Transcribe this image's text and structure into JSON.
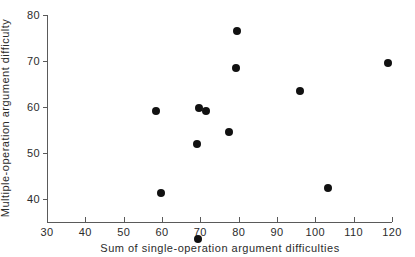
{
  "chart_data": {
    "type": "scatter",
    "title": "",
    "xlabel": "Sum of single-operation argument difficulties",
    "ylabel": "Multiple-operation argument difficulty",
    "xlim": [
      30,
      120
    ],
    "ylim": [
      31,
      80
    ],
    "xticks": [
      30,
      40,
      50,
      60,
      70,
      80,
      90,
      100,
      110,
      120
    ],
    "yticks": [
      40,
      50,
      60,
      70,
      80
    ],
    "xticklabels": [
      "30",
      "40",
      "50",
      "60",
      "70",
      "80",
      "90",
      "100",
      "110",
      "120"
    ],
    "yticklabels": [
      "40",
      "50",
      "60",
      "70",
      "80"
    ],
    "grid": false,
    "legend": null,
    "marker": "filled-circle",
    "marker_color": "#111111",
    "axis_color": "#5a5a5a",
    "background": "#ffffff",
    "points": [
      {
        "x": 58.5,
        "y": 59.2
      },
      {
        "x": 59.8,
        "y": 41.4
      },
      {
        "x": 69.0,
        "y": 52.0
      },
      {
        "x": 69.3,
        "y": 31.2
      },
      {
        "x": 69.6,
        "y": 59.7
      },
      {
        "x": 71.5,
        "y": 59.2
      },
      {
        "x": 77.5,
        "y": 54.6
      },
      {
        "x": 79.3,
        "y": 68.5
      },
      {
        "x": 79.6,
        "y": 76.6
      },
      {
        "x": 96.0,
        "y": 63.4
      },
      {
        "x": 103.2,
        "y": 42.4
      },
      {
        "x": 119.0,
        "y": 69.5
      }
    ]
  }
}
